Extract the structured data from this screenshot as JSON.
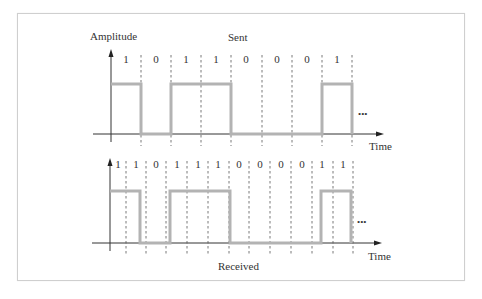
{
  "figure": {
    "sent_title": "Sent",
    "received_title": "Received",
    "y_axis_label": "Amplitude",
    "x_axis_label_top": "Time",
    "x_axis_label_bottom": "Time",
    "ellipsis": "•••",
    "signal_color": "#b3b3b3",
    "axis_color": "#333333",
    "dash_color": "#555555"
  },
  "sent": {
    "bits": [
      "1",
      "0",
      "1",
      "1",
      "0",
      "0",
      "0",
      "1"
    ]
  },
  "received": {
    "bits": [
      "1",
      "1",
      "0",
      "1",
      "1",
      "1",
      "0",
      "0",
      "0",
      "0",
      "1",
      "1"
    ]
  }
}
